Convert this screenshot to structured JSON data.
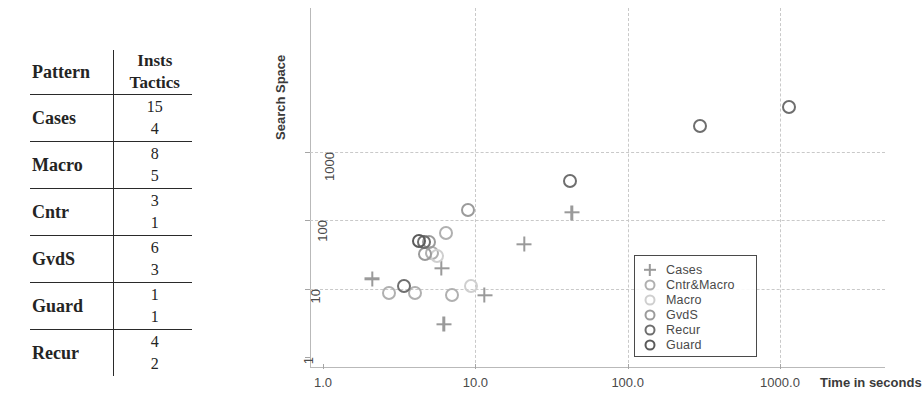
{
  "table": {
    "headers": {
      "pattern": "Pattern",
      "insts": "Insts",
      "tactics": "Tactics"
    },
    "rows": [
      {
        "pattern": "Cases",
        "insts": "15",
        "tactics": "4"
      },
      {
        "pattern": "Macro",
        "insts": "8",
        "tactics": "5"
      },
      {
        "pattern": "Cntr",
        "insts": "3",
        "tactics": "1"
      },
      {
        "pattern": "GvdS",
        "insts": "6",
        "tactics": "3"
      },
      {
        "pattern": "Guard",
        "insts": "1",
        "tactics": "1"
      },
      {
        "pattern": "Recur",
        "insts": "4",
        "tactics": "2"
      }
    ]
  },
  "chart_data": {
    "type": "scatter",
    "title": "",
    "xlabel": "Time in seconds",
    "ylabel": "Search Space",
    "xscale": "log",
    "yscale": "log",
    "xlim": [
      1.0,
      3000.0
    ],
    "ylim": [
      1,
      10000
    ],
    "xticks": [
      1.0,
      10.0,
      100.0,
      1000.0
    ],
    "xticklabels": [
      "1.0",
      "10.0",
      "100.0",
      "1000.0"
    ],
    "yticks": [
      1,
      10,
      100,
      1000
    ],
    "yticklabels": [
      "1",
      "10",
      "100",
      "1000"
    ],
    "grid": true,
    "legend_position": "lower right",
    "series": [
      {
        "name": "Cases",
        "marker": "plus",
        "color": "#9a9a9a",
        "points": [
          {
            "x": 2.1,
            "y": 14
          },
          {
            "x": 6.0,
            "y": 20
          },
          {
            "x": 6.2,
            "y": 3
          },
          {
            "x": 11.5,
            "y": 8
          },
          {
            "x": 21.0,
            "y": 45
          },
          {
            "x": 43.0,
            "y": 130
          }
        ]
      },
      {
        "name": "Cntr&Macro",
        "marker": "circle",
        "color": "#b0b0b0",
        "points": [
          {
            "x": 2.7,
            "y": 8.5
          },
          {
            "x": 4.0,
            "y": 8.5
          },
          {
            "x": 5.2,
            "y": 33
          },
          {
            "x": 6.4,
            "y": 65
          },
          {
            "x": 7.0,
            "y": 8.0
          }
        ]
      },
      {
        "name": "Macro",
        "marker": "circle",
        "color": "#cfcfcf",
        "points": [
          {
            "x": 5.6,
            "y": 30
          },
          {
            "x": 9.3,
            "y": 11
          }
        ]
      },
      {
        "name": "GvdS",
        "marker": "circle",
        "color": "#9b9b9b",
        "points": [
          {
            "x": 4.7,
            "y": 32
          },
          {
            "x": 5.0,
            "y": 48
          },
          {
            "x": 9.0,
            "y": 140
          }
        ]
      },
      {
        "name": "Recur",
        "marker": "circle",
        "color": "#6e6e6e",
        "points": [
          {
            "x": 3.4,
            "y": 11
          },
          {
            "x": 4.6,
            "y": 49
          },
          {
            "x": 42.0,
            "y": 380
          },
          {
            "x": 300.0,
            "y": 2400
          },
          {
            "x": 1150.0,
            "y": 4600
          }
        ]
      },
      {
        "name": "Guard",
        "marker": "circle",
        "color": "#5a5a5a",
        "points": [
          {
            "x": 4.3,
            "y": 50
          }
        ]
      }
    ]
  },
  "legend": {
    "entries": [
      {
        "label": "Cases",
        "marker": "plus",
        "color": "#9a9a9a"
      },
      {
        "label": "Cntr&Macro",
        "marker": "circle",
        "color": "#b0b0b0"
      },
      {
        "label": "Macro",
        "marker": "circle",
        "color": "#cfcfcf"
      },
      {
        "label": "GvdS",
        "marker": "circle",
        "color": "#9b9b9b"
      },
      {
        "label": "Recur",
        "marker": "circle",
        "color": "#6e6e6e"
      },
      {
        "label": "Guard",
        "marker": "circle",
        "color": "#5a5a5a"
      }
    ]
  }
}
